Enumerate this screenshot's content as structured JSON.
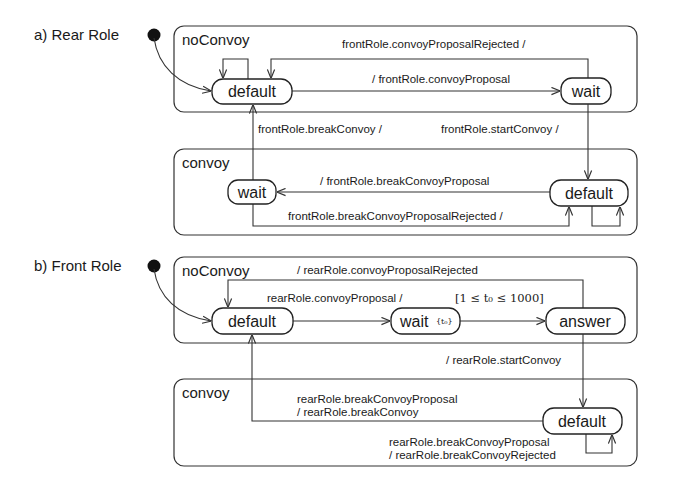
{
  "diagram": {
    "rear_role": {
      "title": "a) Rear Role",
      "noConvoy": {
        "label": "noConvoy",
        "states": {
          "default": "default",
          "wait": "wait"
        },
        "transitions": {
          "rejected": "frontRole.convoyProposalRejected /",
          "proposal": "/ frontRole.convoyProposal"
        }
      },
      "between": {
        "break": "frontRole.breakConvoy /",
        "start": "frontRole.startConvoy /"
      },
      "convoy": {
        "label": "convoy",
        "states": {
          "wait": "wait",
          "default": "default"
        },
        "transitions": {
          "break_proposal": "/ frontRole.breakConvoyProposal",
          "break_rejected": "frontRole.breakConvoyProposalRejected /"
        }
      }
    },
    "front_role": {
      "title": "b) Front Role",
      "noConvoy": {
        "label": "noConvoy",
        "states": {
          "default": "default",
          "wait": "wait",
          "wait_clock": "{t₀}",
          "answer": "answer"
        },
        "transitions": {
          "rejected": "/ rearRole.convoyProposalRejected",
          "proposal": "rearRole.convoyProposal /",
          "guard": "[1 ≤ t₀ ≤ 1000]"
        }
      },
      "between": {
        "start": "/ rearRole.startConvoy"
      },
      "convoy": {
        "label": "convoy",
        "states": {
          "default": "default"
        },
        "transitions": {
          "break_line1": "rearRole.breakConvoyProposal",
          "break_line2": "/ rearRole.breakConvoy",
          "rejected_line1": "rearRole.breakConvoyProposal",
          "rejected_line2": "/ rearRole.breakConvoyRejected"
        }
      }
    }
  }
}
